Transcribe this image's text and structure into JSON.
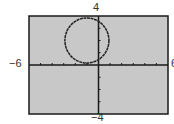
{
  "chart_data": {
    "type": "line",
    "title": "",
    "xlabel": "",
    "ylabel": "",
    "xlim": [
      -6,
      6
    ],
    "ylim": [
      -4,
      4
    ],
    "x_tick_step": 1,
    "y_tick_step": 1,
    "grid": false,
    "legend": null,
    "tick_labels": {
      "xmin": "−6",
      "xmax": "6",
      "ymin": "−4",
      "ymax": "4"
    },
    "series": [
      {
        "name": "circle",
        "shape": "circle",
        "center": [
          -1,
          2
        ],
        "radius": 2,
        "description": "Closed circular curve tangent near origin, spanning x≈-3 to 1 and y≈0 to 4"
      }
    ]
  },
  "colors": {
    "plot_background": "#c8c8c8",
    "frame": "#1a1a1a",
    "axes": "#1a1a1a",
    "curve": "#222222",
    "page_background": "#ffffff"
  }
}
